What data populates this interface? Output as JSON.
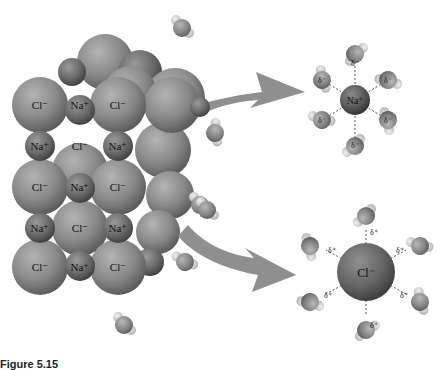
{
  "figure": {
    "caption": "Figure 5.15",
    "crystal": {
      "rows": [
        [
          "Cl⁻",
          "Na⁺",
          "Cl⁻"
        ],
        [
          "Na⁺",
          "Cl⁻",
          "Na⁺"
        ],
        [
          "Cl⁻",
          "Na⁺",
          "Cl⁻"
        ],
        [
          "Na⁺",
          "Cl⁻",
          "Na⁺"
        ],
        [
          "Cl⁻",
          "Na⁺",
          "Cl⁻"
        ]
      ]
    },
    "hydrated_sodium": {
      "ion_label": "Na⁺",
      "partial_charge": "δ⁻",
      "water_count": 6
    },
    "hydrated_chloride": {
      "ion_label": "Cl⁻",
      "partial_charge": "δ⁺",
      "water_count": 6
    },
    "colors": {
      "chloride": "#8a8a8a",
      "sodium": "#6e6e6e",
      "oxygen": "#8c8c8c",
      "hydrogen": "#d0d0d0",
      "arrow": "#8f8f8f",
      "background": "#ffffff"
    }
  }
}
